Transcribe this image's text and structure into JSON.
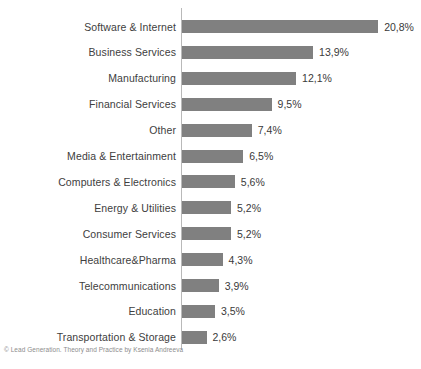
{
  "credit": "© Lead Generation. Theory and Practice by Ksenia Andreeva",
  "chart_data": {
    "type": "bar",
    "orientation": "horizontal",
    "title": "",
    "xlabel": "",
    "ylabel": "",
    "grid": false,
    "legend": false,
    "xlim": [
      0,
      20.8
    ],
    "value_suffix": "%",
    "decimal_separator": ",",
    "bar_color": "#808080",
    "axis_color": "#b9b9b9",
    "categories": [
      "Software & Internet",
      "Business Services",
      "Manufacturing",
      "Financial Services",
      "Other",
      "Media & Entertainment",
      "Computers & Electronics",
      "Energy & Utilities",
      "Consumer Services",
      "Healthcare&Pharma",
      "Telecommunications",
      "Education",
      "Transportation & Storage"
    ],
    "values": [
      20.8,
      13.9,
      12.1,
      9.5,
      7.4,
      6.5,
      5.6,
      5.2,
      5.2,
      4.3,
      3.9,
      3.5,
      2.6
    ],
    "value_labels": [
      "20,8%",
      "13,9%",
      "12,1%",
      "9,5%",
      "7,4%",
      "6,5%",
      "5,6%",
      "5,2%",
      "5,2%",
      "4,3%",
      "3,9%",
      "3,5%",
      "2,6%"
    ]
  }
}
